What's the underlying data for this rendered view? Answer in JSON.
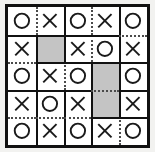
{
  "figure": {
    "kind": "puzzle-grid",
    "rows": 5,
    "cols": 5,
    "border_color": "#111111",
    "cell_fill": "#ffffff",
    "shaded_fill": "#c4c4c4",
    "page_background": "#f2f2f0",
    "mark_color": "#1a1a1a"
  },
  "grid": {
    "cells": [
      [
        {
          "mark": "O",
          "shaded": false
        },
        {
          "mark": "X",
          "shaded": false
        },
        {
          "mark": "O",
          "shaded": false
        },
        {
          "mark": "X",
          "shaded": false
        },
        {
          "mark": "O",
          "shaded": false
        }
      ],
      [
        {
          "mark": "X",
          "shaded": false
        },
        {
          "mark": "",
          "shaded": true
        },
        {
          "mark": "X",
          "shaded": false
        },
        {
          "mark": "O",
          "shaded": false
        },
        {
          "mark": "X",
          "shaded": false
        }
      ],
      [
        {
          "mark": "O",
          "shaded": false
        },
        {
          "mark": "X",
          "shaded": false
        },
        {
          "mark": "O",
          "shaded": false
        },
        {
          "mark": "",
          "shaded": true
        },
        {
          "mark": "O",
          "shaded": false
        }
      ],
      [
        {
          "mark": "X",
          "shaded": false
        },
        {
          "mark": "O",
          "shaded": false
        },
        {
          "mark": "X",
          "shaded": false
        },
        {
          "mark": "",
          "shaded": true
        },
        {
          "mark": "X",
          "shaded": false
        }
      ],
      [
        {
          "mark": "O",
          "shaded": false
        },
        {
          "mark": "X",
          "shaded": false
        },
        {
          "mark": "O",
          "shaded": false
        },
        {
          "mark": "X",
          "shaded": false
        },
        {
          "mark": "O",
          "shaded": false
        }
      ]
    ],
    "vertical_dividers": [
      [
        "dotted",
        "solid",
        "dotted",
        "solid"
      ],
      [
        "solid",
        "solid",
        "dotted",
        "solid"
      ],
      [
        "solid",
        "dotted",
        "solid",
        "solid"
      ],
      [
        "solid",
        "solid",
        "solid",
        "solid"
      ],
      [
        "solid",
        "solid",
        "solid",
        "dotted"
      ]
    ],
    "horizontal_dividers": [
      [
        "solid",
        "solid",
        "solid",
        "solid",
        "dotted"
      ],
      [
        "dotted",
        "solid",
        "solid",
        "solid",
        "solid"
      ],
      [
        "solid",
        "solid",
        "solid",
        "dotted",
        "solid"
      ],
      [
        "dotted",
        "dotted",
        "dotted",
        "solid",
        "solid"
      ]
    ]
  }
}
